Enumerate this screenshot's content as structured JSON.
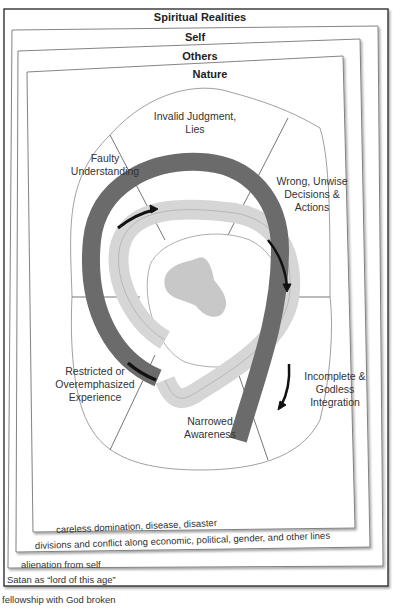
{
  "frames": {
    "spiritual": {
      "title": "Spiritual Realities",
      "caption": "fellowship with God broken"
    },
    "self": {
      "title": "Self",
      "caption": "Satan as “lord of this age”"
    },
    "others": {
      "title": "Others",
      "caption": "alienation from self"
    },
    "nature": {
      "title": "Nature",
      "caption": "divisions and conflict along economic, political, gender, and other lines"
    },
    "inner": {
      "caption": "careless domination, disease, disaster"
    }
  },
  "segments": [
    {
      "id": "faulty-understanding",
      "label_lines": [
        "Faulty",
        "Understanding"
      ]
    },
    {
      "id": "invalid-judgment",
      "label_lines": [
        "Invalid Judgment,",
        "Lies"
      ]
    },
    {
      "id": "wrong-decisions",
      "label_lines": [
        "Wrong, Unwise",
        "Decisions &",
        "Actions"
      ]
    },
    {
      "id": "incomplete-integration",
      "label_lines": [
        "Incomplete &",
        "Godless",
        "Integration"
      ]
    },
    {
      "id": "narrowed-awareness",
      "label_lines": [
        "Narrowed",
        "Awareness"
      ]
    },
    {
      "id": "restricted-experience",
      "label_lines": [
        "Restricted or",
        "Overemphasized",
        "Experience"
      ]
    }
  ],
  "colors": {
    "dark_band": "#6b6b6b",
    "light_band": "#dadada",
    "core_blob": "#c8c8c8",
    "frame_stroke": "#555555",
    "arrow": "#111111"
  }
}
